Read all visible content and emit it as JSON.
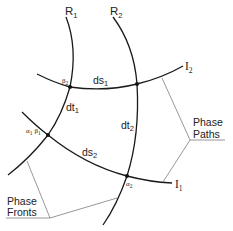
{
  "diagram": {
    "rays": [
      {
        "id": "R1",
        "label": "R",
        "sub": "1"
      },
      {
        "id": "R2",
        "label": "R",
        "sub": "2"
      }
    ],
    "fronts": [
      {
        "id": "I1",
        "label": "I",
        "sub": "1"
      },
      {
        "id": "I2",
        "label": "I",
        "sub": "2"
      }
    ],
    "segments": {
      "ds1": {
        "label": "ds",
        "sub": "1"
      },
      "ds2": {
        "label": "ds",
        "sub": "2"
      },
      "dt1": {
        "label": "dt",
        "sub": "1"
      },
      "dt2": {
        "label": "dt",
        "sub": "2"
      }
    },
    "points": {
      "beta2": {
        "label": "β",
        "sub": "2"
      },
      "alpha1beta1": {
        "label1": "α",
        "sub1": "1",
        "label2": "β",
        "sub2": "1"
      },
      "alpha2": {
        "label": "α",
        "sub": "2"
      }
    },
    "callouts": {
      "phase_paths": {
        "line1": "Phase",
        "line2": "Paths"
      },
      "phase_fronts": {
        "line1": "Phase",
        "line2": "Fronts"
      }
    },
    "colors": {
      "curve": "#1a1a1a",
      "leader": "#6a6a6a",
      "background": "#ffffff"
    }
  }
}
